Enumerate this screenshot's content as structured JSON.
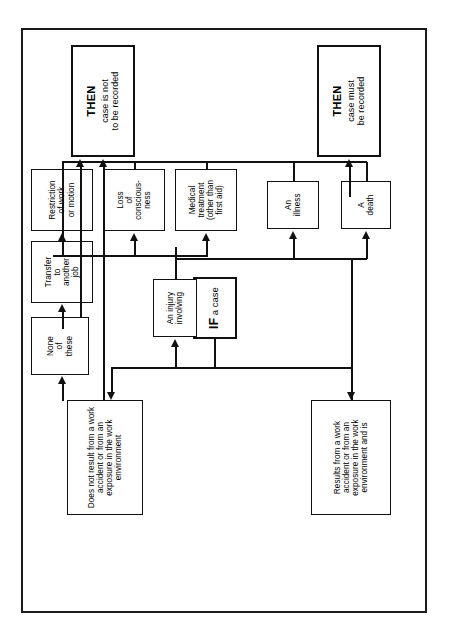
{
  "caption": "(Source: County Washington DC)",
  "diagram": {
    "nodes": {
      "if_case": {
        "head": "IF",
        "body": "a case"
      },
      "not_result": {
        "body": "Does not result from a work accident or from an exposure in the work environment"
      },
      "results_from": {
        "body": "Results from a work accident or from an exposure in the work environment and is"
      },
      "death": {
        "line1": "A",
        "line2": "death"
      },
      "illness": {
        "line1": "An",
        "line2": "illness"
      },
      "injury": {
        "line1": "An injury",
        "line2": "involving"
      },
      "medical": {
        "line1": "Medical",
        "line2": "treatment",
        "line3": "(other than",
        "line4": "first aid)"
      },
      "loss": {
        "line1": "Loss",
        "line2": "of",
        "line3": "conscious-",
        "line4": "ness"
      },
      "restriction": {
        "line1": "Restriction",
        "line2": "of work",
        "line3": "or motion"
      },
      "transfer": {
        "line1": "Transfer",
        "line2": "to",
        "line3": "another",
        "line4": "job"
      },
      "none": {
        "line1": "None",
        "line2": "of",
        "line3": "these"
      },
      "then_record": {
        "head": "THEN",
        "line1": "case must",
        "line2": "be recorded"
      },
      "then_not_record": {
        "head": "THEN",
        "line1": "case is not",
        "line2": "to be recorded"
      }
    },
    "colors": {
      "ink": "#111111",
      "paper": "#ffffff"
    }
  }
}
